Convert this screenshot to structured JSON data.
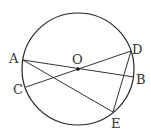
{
  "diagram": {
    "center_label": "O",
    "points": {
      "A": "A",
      "B": "B",
      "C": "C",
      "D": "D",
      "E": "E"
    },
    "segments": [
      "AB",
      "CD",
      "AE",
      "DE"
    ]
  }
}
